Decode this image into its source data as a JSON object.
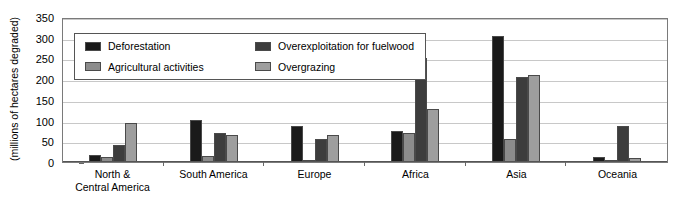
{
  "chart_data": {
    "type": "bar",
    "title": "",
    "subtitle": "",
    "xlabel": "",
    "ylabel": "(millions of hectares degraded)",
    "ylim": [
      0,
      350
    ],
    "ytick_step": 50,
    "yticks": [
      350,
      300,
      250,
      200,
      150,
      100,
      50,
      0
    ],
    "grid": true,
    "legend_position": "top-left-inside",
    "categories": [
      "North &\nCentral America",
      "South America",
      "Europe",
      "Africa",
      "Asia",
      "Oceania"
    ],
    "category_lines": [
      [
        "North &",
        "Central America"
      ],
      [
        "South America"
      ],
      [
        "Europe"
      ],
      [
        "Africa"
      ],
      [
        "Asia"
      ],
      [
        "Oceania"
      ]
    ],
    "series": [
      {
        "name": "Deforestation",
        "color": "#1a1a1a",
        "values": [
          18,
          101,
          86,
          75,
          305,
          12
        ]
      },
      {
        "name": "Agricultural activities",
        "color": "#8c8c8c",
        "values": [
          12,
          15,
          5,
          71,
          55,
          3
        ]
      },
      {
        "name": "Overexploitation for fuelwood",
        "color": "#3d3d3d",
        "values": [
          41,
          70,
          55,
          251,
          205,
          88
        ]
      },
      {
        "name": "Overgrazing",
        "color": "#9e9e9e",
        "values": [
          93,
          66,
          66,
          129,
          210,
          10
        ]
      }
    ]
  },
  "colors": {
    "deforestation": "#1a1a1a",
    "agricultural_activities": "#8c8c8c",
    "overexploitation_for_fuelwood": "#3d3d3d",
    "overgrazing": "#9e9e9e",
    "gridline": "#c8c8c8",
    "axis": "#555555",
    "plot_border": "#7a7a7a",
    "background": "#ffffff",
    "text": "#000000"
  }
}
